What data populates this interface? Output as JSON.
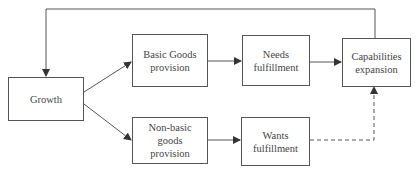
{
  "diagram": {
    "nodes": [
      {
        "id": "growth",
        "label": "Growth"
      },
      {
        "id": "basic",
        "label": "Basic Goods\nprovision"
      },
      {
        "id": "nonbasic",
        "label": "Non-basic\ngoods\nprovision"
      },
      {
        "id": "needs",
        "label": "Needs\nfulfillment"
      },
      {
        "id": "wants",
        "label": "Wants\nfulfillment"
      },
      {
        "id": "capabilities",
        "label": "Capabilities\nexpansion"
      }
    ],
    "edges": [
      {
        "from": "growth",
        "to": "basic",
        "style": "solid"
      },
      {
        "from": "growth",
        "to": "nonbasic",
        "style": "solid"
      },
      {
        "from": "basic",
        "to": "needs",
        "style": "solid"
      },
      {
        "from": "needs",
        "to": "capabilities",
        "style": "solid"
      },
      {
        "from": "nonbasic",
        "to": "wants",
        "style": "solid"
      },
      {
        "from": "wants",
        "to": "capabilities",
        "style": "dashed"
      },
      {
        "from": "capabilities",
        "to": "growth",
        "style": "solid",
        "note": "feedback loop"
      }
    ],
    "colors": {
      "line": "#555555",
      "text": "#444444"
    }
  }
}
